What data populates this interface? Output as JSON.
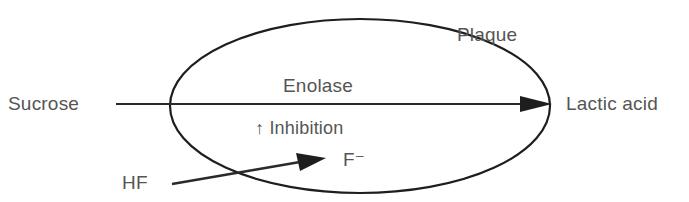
{
  "diagram": {
    "container_label": "Plaque",
    "enzyme_label": "Enolase",
    "substrate_label": "Sucrose",
    "product_label": "Lactic acid",
    "effect_label": "↑ Inhibition",
    "inhibitor_ion_label": "F⁻",
    "source_label": "HF"
  },
  "colors": {
    "line": "#1e1e1e",
    "text": "#555555",
    "background": "#ffffff"
  }
}
